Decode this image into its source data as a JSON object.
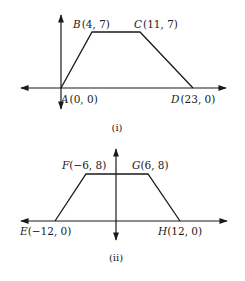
{
  "figures": [
    {
      "caption": "(i)",
      "points": [
        {
          "letter": "A",
          "coords": "(0, 0)",
          "x": 0,
          "y": 0
        },
        {
          "letter": "B",
          "coords": "(4, 7)",
          "x": 4,
          "y": 7
        },
        {
          "letter": "C",
          "coords": "(11, 7)",
          "x": 11,
          "y": 7
        },
        {
          "letter": "D",
          "coords": "(23, 0)",
          "x": 23,
          "y": 0
        }
      ]
    },
    {
      "caption": "(ii)",
      "points": [
        {
          "letter": "E",
          "coords": "(−12, 0)",
          "x": -12,
          "y": 0
        },
        {
          "letter": "F",
          "coords": "(−6, 8)",
          "x": -6,
          "y": 8
        },
        {
          "letter": "G",
          "coords": "(6, 8)",
          "x": 6,
          "y": 8
        },
        {
          "letter": "H",
          "coords": "(12, 0)",
          "x": 12,
          "y": 0
        }
      ]
    }
  ],
  "colors": {
    "ink": "#1a1a1a",
    "background": "#ffffff"
  }
}
